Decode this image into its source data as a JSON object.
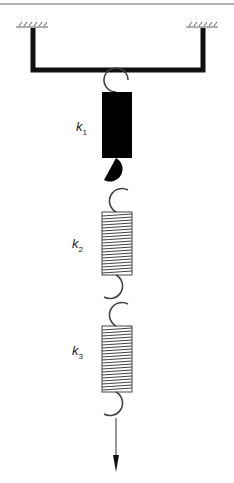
{
  "diagram": {
    "springs": [
      {
        "label": "k",
        "subscript": "1"
      },
      {
        "label": "k",
        "subscript": "2"
      },
      {
        "label": "k",
        "subscript": "3"
      }
    ],
    "colors": {
      "line": "#111111",
      "spring": "#444444"
    }
  }
}
